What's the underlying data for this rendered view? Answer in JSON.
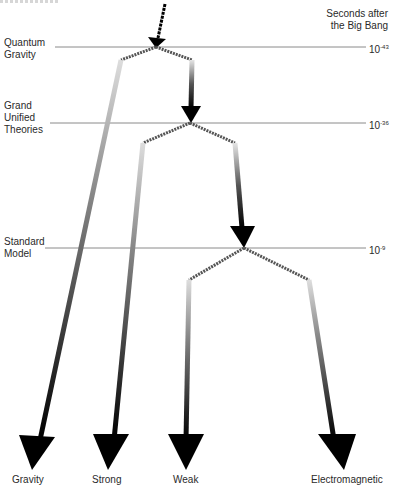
{
  "header": {
    "time_axis_title_line1": "Seconds after",
    "time_axis_title_line2": "the Big Bang"
  },
  "eras": [
    {
      "name_line1": "Quantum",
      "name_line2": "Gravity",
      "name_line3": "",
      "time_base": "10",
      "time_exp": "-43"
    },
    {
      "name_line1": "Grand",
      "name_line2": "Unified",
      "name_line3": "Theories",
      "time_base": "10",
      "time_exp": "-36"
    },
    {
      "name_line1": "Standard",
      "name_line2": "Model",
      "name_line3": "",
      "time_base": "10",
      "time_exp": "-9"
    }
  ],
  "forces": [
    {
      "label": "Gravity"
    },
    {
      "label": "Strong"
    },
    {
      "label": "Weak"
    },
    {
      "label": "Electromagnetic"
    }
  ],
  "colors": {
    "arrow": "#000000",
    "era_line": "#888888",
    "text": "#2a2a2a"
  }
}
